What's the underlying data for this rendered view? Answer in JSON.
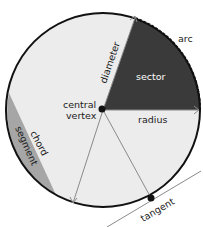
{
  "diagram": {
    "labels": {
      "arc": "arc",
      "sector": "sector",
      "diameter": "diameter",
      "radius": "radius",
      "central_vertex_line1": "central",
      "central_vertex_line2": "vertex",
      "chord": "chord",
      "segment": "segment",
      "tangent": "tangent"
    },
    "colors": {
      "circle_fill": "#ececec",
      "circle_stroke": "#111111",
      "sector_fill": "#3a3a3a",
      "segment_fill": "#a6a6a6",
      "line_color": "#8a8a8a",
      "label_dark": "#1a1a1a",
      "label_light": "#ffffff"
    }
  }
}
